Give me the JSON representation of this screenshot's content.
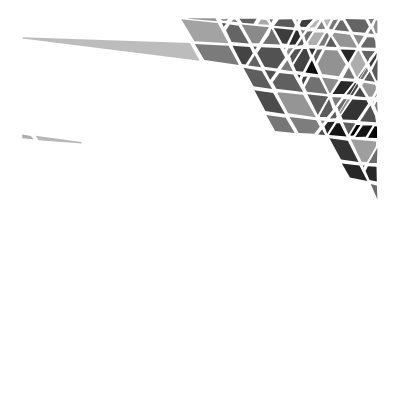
{
  "canvas": {
    "width": 395,
    "height": 403,
    "background_color": "#ffffff",
    "title": "Abstract Triangular Line Mosaic"
  },
  "artwork": {
    "name": "generative-triangle-mosaic",
    "description": "Procedural abstract composition of overlapping straight lines partitioning the plane into triangular and polygonal cells filled with random grayscale tones on a white ground.",
    "style": "generative-abstract",
    "gutter_color": "#ffffff",
    "gutter_width": 4.2,
    "palette": [
      "#000000",
      "#141414",
      "#262626",
      "#333333",
      "#3f3f3f",
      "#4d4d4d",
      "#5c5c5c",
      "#6b6b6b",
      "#7a7a7a",
      "#8c8c8c",
      "#9e9e9e"
    ],
    "margins": {
      "top": 18,
      "right": 17,
      "bottom": 22,
      "left": 20
    },
    "density_center": {
      "x": 0.54,
      "y": 0.52
    },
    "fade_radius": 0.62
  },
  "chart_data": {
    "type": "scatter",
    "xlabel": "",
    "ylabel": "",
    "xlim": [
      0,
      395
    ],
    "ylim": [
      0,
      403
    ],
    "grid": false,
    "legend": "none",
    "angle_families_deg": [
      6,
      62,
      -58,
      118
    ],
    "line_count": 96,
    "cell_count": 430,
    "tone_range": [
      0,
      160
    ]
  },
  "generator": {
    "seed": 20743,
    "lines_per_family": 24,
    "jitter": 0.32,
    "min_cell_area": 14,
    "max_cell_area": 1900
  }
}
